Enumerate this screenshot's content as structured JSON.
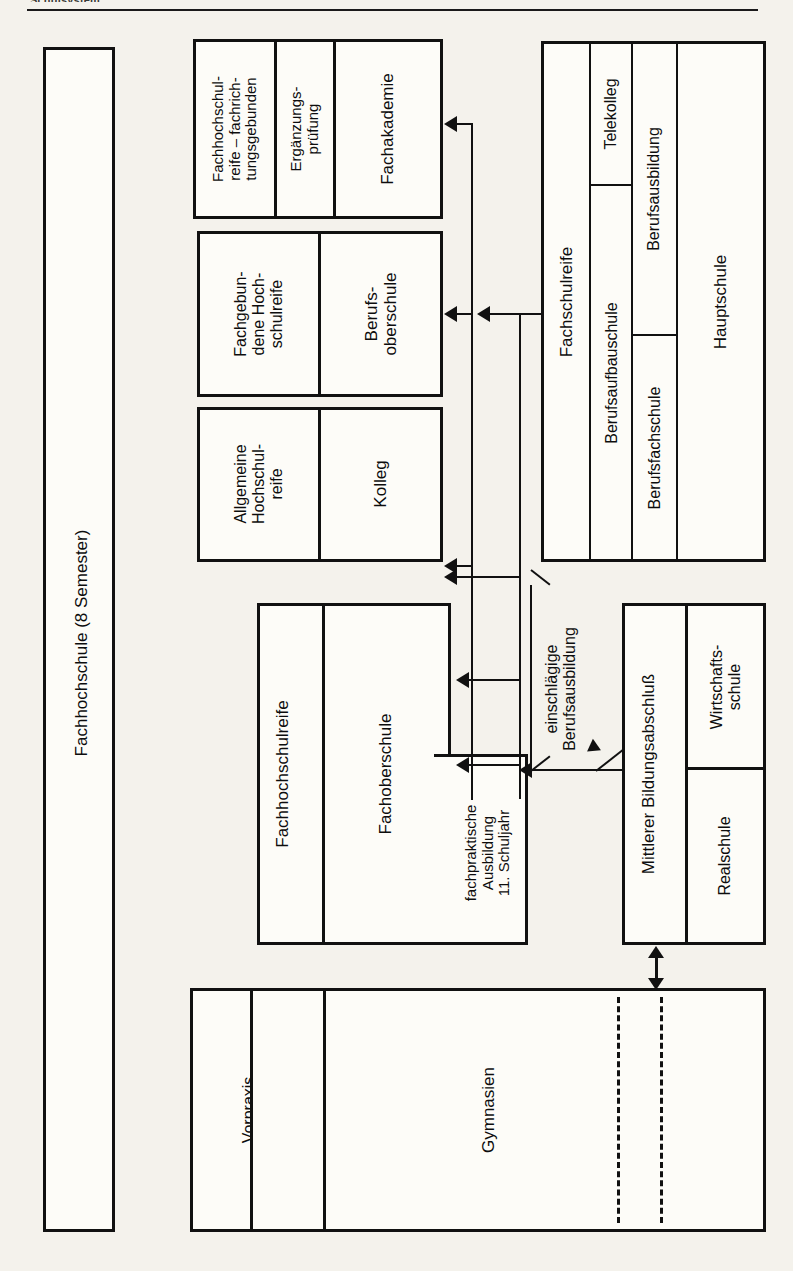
{
  "page": {
    "clipped_header": "Schulsystem",
    "background": "#f4f2ec",
    "ink": "#111111"
  },
  "diagram": {
    "orientation": "text rotated 90 degrees counter-clockwise",
    "nodes": {
      "fachhochschule": {
        "label": "Fachhochschule (8 Semester)"
      },
      "fachakademie_group": {
        "qualification": "Fachhochschul-\nreife – fachrich-\ntungsgebunden",
        "exam": "Ergänzungs-\nprüfung",
        "school": "Fachakademie"
      },
      "berufsoberschule_group": {
        "qualification": "Fachgebun-\ndene Hoch-\nschulreife",
        "school": "Berufs-\noberschule"
      },
      "kolleg_group": {
        "qualification": "Allgemeine\nHochschul-\nreife",
        "school": "Kolleg"
      },
      "fachoberschule_group": {
        "qualification": "Fachhochschulreife",
        "school": "Fachoberschule",
        "practical": "fachpraktische\nAusbildung\n11. Schuljahr"
      },
      "fachschulreife_group": {
        "qualification": "Fachschulreife",
        "berufsaufbauschule": "Berufsaufbauschule",
        "telekolleg": "Telekolleg",
        "berufsausbildung": "Berufsausbildung",
        "berufsfachschule": "Berufsfachschule",
        "hauptschule": "Hauptschule"
      },
      "mittlerer_group": {
        "qualification": "Mittlerer Bildungsabschluß",
        "wirtschaftsschule": "Wirtschafts-\nschule",
        "realschule": "Realschule"
      },
      "gymnasien_group": {
        "vorpraxis": "Vorpraxis",
        "qualification": "Allgemeine\nHochschulreife",
        "school": "Gymnasien"
      }
    },
    "edge_labels": {
      "einschlaegige": "einschlägige\nBerufsausbildung"
    }
  }
}
